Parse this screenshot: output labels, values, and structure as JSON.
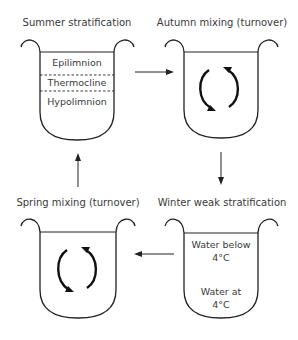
{
  "panels": {
    "summer": {
      "title": "Summer stratification",
      "layers": [
        "Epilimnion",
        "Thermocline",
        "Hypolimnion"
      ]
    },
    "autumn": {
      "title": "Autumn mixing (turnover)",
      "icon": "circular-mixing-arrows-icon"
    },
    "winter": {
      "title": "Winter weak stratification",
      "upper_label_line1": "Water below",
      "upper_label_line2": "4°C",
      "lower_label_line1": "Water at",
      "lower_label_line2": "4°C"
    },
    "spring": {
      "title": "Spring mixing (turnover)",
      "icon": "circular-mixing-arrows-icon"
    }
  },
  "flow": [
    "summer",
    "autumn",
    "winter",
    "spring",
    "summer"
  ],
  "colors": {
    "line": "#222222",
    "text": "#3a3a3a",
    "background": "#ffffff"
  }
}
